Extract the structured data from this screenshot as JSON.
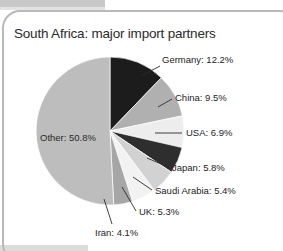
{
  "chart_data": {
    "type": "pie",
    "title": "South Africa: major import partners",
    "xlabel": "",
    "ylabel": "",
    "legend_position": "none",
    "grid": false,
    "categories": [
      "Germany",
      "China",
      "USA",
      "Japan",
      "Saudi Arabia",
      "UK",
      "Iran",
      "Other"
    ],
    "values": [
      12.2,
      9.5,
      6.9,
      5.8,
      5.4,
      5.3,
      4.1,
      50.8
    ],
    "unit": "%",
    "start_angle_deg": 0,
    "direction": "clockwise",
    "slices": [
      {
        "name": "Germany",
        "value": 12.2,
        "label": "Germany: 12.2%",
        "color": "#1c1c1c",
        "label_placement": "callout-right"
      },
      {
        "name": "China",
        "value": 9.5,
        "label": "China: 9.5%",
        "color": "#b0b0b0",
        "label_placement": "callout-right"
      },
      {
        "name": "USA",
        "value": 6.9,
        "label": "USA: 6.9%",
        "color": "#ededed",
        "label_placement": "callout-right"
      },
      {
        "name": "Japan",
        "value": 5.8,
        "label": "Japan: 5.8%",
        "color": "#2e2e2e",
        "label_placement": "callout-right"
      },
      {
        "name": "Saudi Arabia",
        "value": 5.4,
        "label": "Saudi Arabia: 5.4%",
        "color": "#d2d2d2",
        "label_placement": "callout-right"
      },
      {
        "name": "UK",
        "value": 5.3,
        "label": "UK: 5.3%",
        "color": "#f2f2f2",
        "label_placement": "callout-bottom-right"
      },
      {
        "name": "Iran",
        "value": 4.1,
        "label": "Iran: 4.1%",
        "color": "#a6a6a6",
        "label_placement": "callout-bottom"
      },
      {
        "name": "Other",
        "value": 50.8,
        "label": "Other: 50.8%",
        "color": "#bdbdbd",
        "label_placement": "inside"
      }
    ]
  },
  "labels": {
    "germany": "Germany: 12.2%",
    "china": "China: 9.5%",
    "usa": "USA: 6.9%",
    "japan": "Japan: 5.8%",
    "saudi_arabia": "Saudi Arabia: 5.4%",
    "uk": "UK: 5.3%",
    "iran": "Iran: 4.1%",
    "other": "Other: 50.8%"
  },
  "title": "South Africa: major import partners",
  "colors": {
    "frame": "#b9b9b9",
    "background": "#ffffff",
    "text": "#232323",
    "edge_strip": "#c8c8c8"
  }
}
